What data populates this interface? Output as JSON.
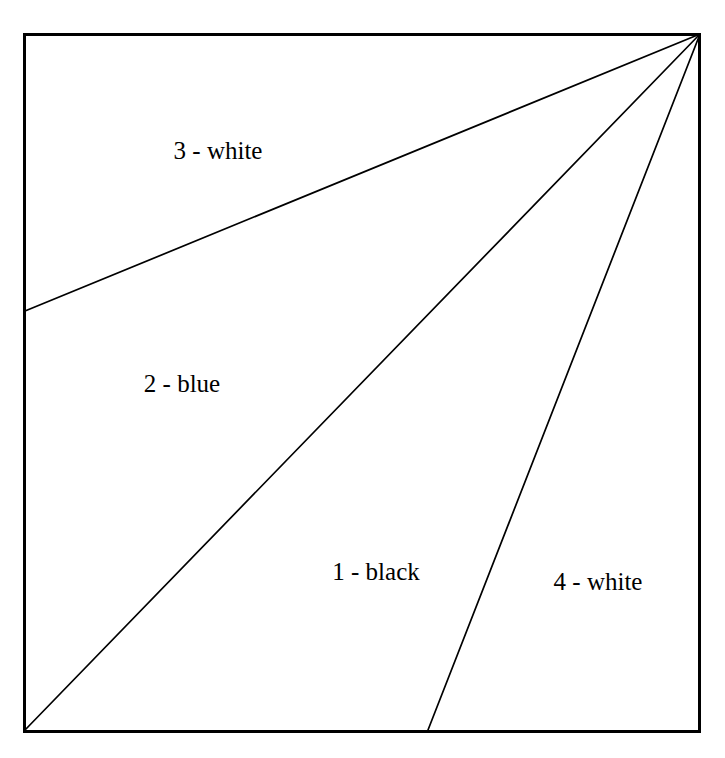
{
  "figure": {
    "type": "geometric-partition-diagram",
    "background_color": "#ffffff",
    "stroke_color": "#000000",
    "frame": {
      "name": "outer-square",
      "x": 23,
      "y": 33,
      "width": 677,
      "height": 699,
      "border_width": 3,
      "fill": "none"
    },
    "apex": {
      "label": "top-right-corner-apex",
      "x": 700,
      "y": 33
    },
    "lines": [
      {
        "name": "line-1-upper",
        "from": [
          700,
          33
        ],
        "to": [
          24,
          311
        ],
        "stroke_width": 1.6,
        "separates": [
          "3 - white",
          "2 - blue"
        ]
      },
      {
        "name": "line-2-middle",
        "from": [
          700,
          33
        ],
        "to": [
          24,
          731
        ],
        "stroke_width": 1.6,
        "separates": [
          "2 - blue",
          "1 - black"
        ]
      },
      {
        "name": "line-3-lower",
        "from": [
          700,
          33
        ],
        "to": [
          428,
          731
        ],
        "stroke_width": 1.6,
        "separates": [
          "1 - black",
          "4 - white"
        ]
      }
    ],
    "regions": [
      {
        "id": 3,
        "label": "3 - white",
        "number": "3",
        "color_name": "white",
        "label_x": 218,
        "label_y": 150
      },
      {
        "id": 2,
        "label": "2 - blue",
        "number": "2",
        "color_name": "blue",
        "label_x": 182,
        "label_y": 383
      },
      {
        "id": 1,
        "label": "1 - black",
        "number": "1",
        "color_name": "black",
        "label_x": 376,
        "label_y": 571
      },
      {
        "id": 4,
        "label": "4 - white",
        "number": "4",
        "color_name": "white",
        "label_x": 598,
        "label_y": 581
      }
    ],
    "title_remnant": "---"
  }
}
